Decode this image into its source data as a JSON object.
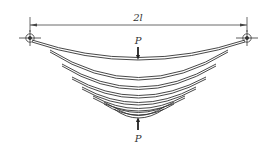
{
  "diagram": {
    "dimension_label": "2l",
    "load_top_label": "P",
    "load_bottom_label": "P",
    "supports": [
      "left-pin",
      "right-pin"
    ],
    "leaf_count": 8,
    "colors": {
      "line": "#333333",
      "leaf_fill": "#ffffff",
      "background": "#ffffff"
    }
  }
}
